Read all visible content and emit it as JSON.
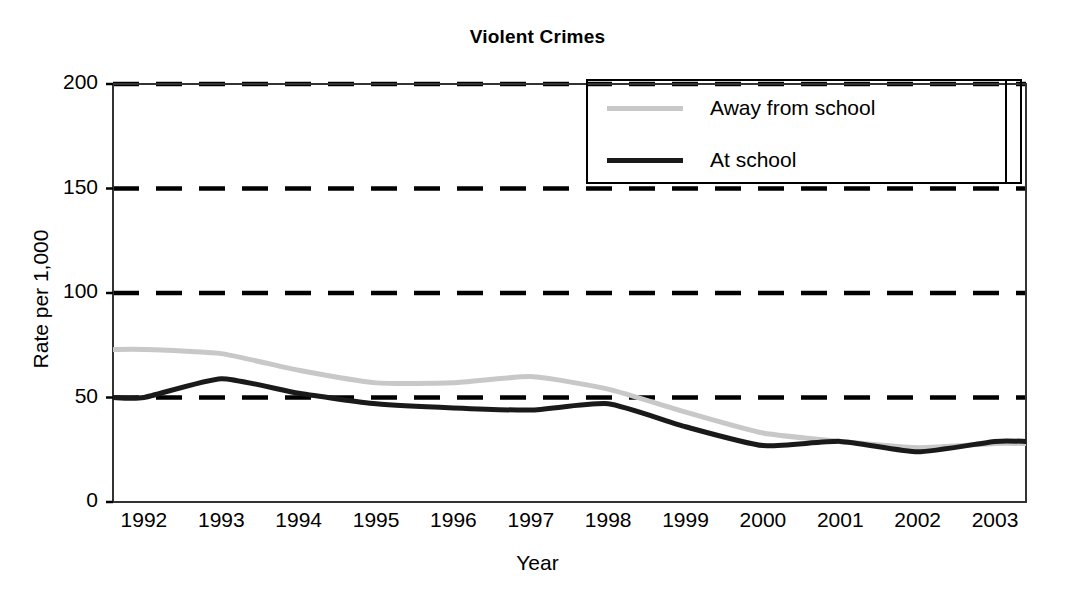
{
  "chart_data": {
    "type": "line",
    "title": "Violent Crimes",
    "xlabel": "Year",
    "ylabel": "Rate per 1,000",
    "ylim": [
      0,
      200
    ],
    "yticks": [
      0,
      50,
      100,
      150,
      200
    ],
    "xlim": [
      1991.6,
      2003.4
    ],
    "categories": [
      1992,
      1993,
      1994,
      1995,
      1996,
      1997,
      1998,
      1999,
      2000,
      2001,
      2002,
      2003
    ],
    "xticks": [
      "1992",
      "1993",
      "1994",
      "1995",
      "1996",
      "1997",
      "1998",
      "1999",
      "2000",
      "2001",
      "2002",
      "2003"
    ],
    "grid": "horizontal-dashed",
    "legend_position": "upper-right",
    "series": [
      {
        "name": "Away from school",
        "color": "#c8c8c8",
        "line_width": 5,
        "values": [
          73,
          71,
          63,
          57,
          57,
          60,
          54,
          43,
          33,
          29,
          26,
          28
        ]
      },
      {
        "name": "At school",
        "color": "#1a1a1a",
        "line_width": 5,
        "values": [
          50,
          59,
          52,
          47,
          45,
          44,
          47,
          36,
          27,
          29,
          24,
          29
        ]
      }
    ]
  },
  "legend": {
    "entries": [
      {
        "label": "Away from school"
      },
      {
        "label": "At school"
      }
    ]
  }
}
